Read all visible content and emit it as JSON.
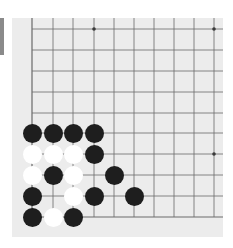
{
  "board": {
    "background": "#ececec",
    "line_color": "#6a6a6a",
    "x_lines": [
      32,
      53,
      73,
      94,
      114,
      134,
      154,
      174,
      194,
      214
    ],
    "y_lines": [
      29,
      50,
      71,
      92,
      113,
      133,
      154,
      175,
      196,
      217
    ],
    "edges": {
      "left": true,
      "bottom": true,
      "top": false,
      "right": false
    },
    "star_points": [
      {
        "col": 3,
        "row": 0
      },
      {
        "col": 9,
        "row": 0
      },
      {
        "col": 9,
        "row": 6
      }
    ]
  },
  "stones": [
    {
      "color": "black",
      "col": 0,
      "row": 5
    },
    {
      "color": "black",
      "col": 1,
      "row": 5
    },
    {
      "color": "black",
      "col": 2,
      "row": 5
    },
    {
      "color": "black",
      "col": 3,
      "row": 5
    },
    {
      "color": "white",
      "col": 0,
      "row": 6
    },
    {
      "color": "white",
      "col": 1,
      "row": 6
    },
    {
      "color": "white",
      "col": 2,
      "row": 6
    },
    {
      "color": "black",
      "col": 3,
      "row": 6
    },
    {
      "color": "white",
      "col": 0,
      "row": 7
    },
    {
      "color": "black",
      "col": 1,
      "row": 7
    },
    {
      "color": "white",
      "col": 2,
      "row": 7
    },
    {
      "color": "black",
      "col": 4,
      "row": 7
    },
    {
      "color": "black",
      "col": 0,
      "row": 8
    },
    {
      "color": "white",
      "col": 2,
      "row": 8
    },
    {
      "color": "black",
      "col": 3,
      "row": 8
    },
    {
      "color": "black",
      "col": 5,
      "row": 8
    },
    {
      "color": "black",
      "col": 0,
      "row": 9
    },
    {
      "color": "white",
      "col": 1,
      "row": 9
    },
    {
      "color": "black",
      "col": 2,
      "row": 9
    }
  ],
  "summary": {
    "black_count": 12,
    "white_count": 7
  }
}
